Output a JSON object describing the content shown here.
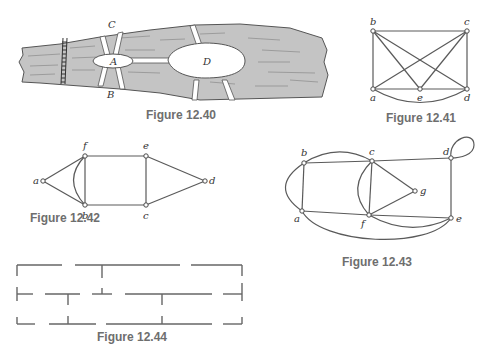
{
  "figures": {
    "fig40": {
      "caption": "Figure 12.40",
      "labels": {
        "A": "A",
        "B": "B",
        "C": "C",
        "D": "D"
      },
      "colors": {
        "river": "#c4c4c4",
        "land": "#ffffff",
        "outline": "#555555"
      }
    },
    "fig41": {
      "caption": "Figure 12.41",
      "vertices": [
        "a",
        "b",
        "c",
        "d",
        "e"
      ],
      "edges": [
        [
          "b",
          "c"
        ],
        [
          "b",
          "a"
        ],
        [
          "c",
          "d"
        ],
        [
          "a",
          "e"
        ],
        [
          "e",
          "d"
        ],
        [
          "b",
          "e"
        ],
        [
          "b",
          "d"
        ],
        [
          "c",
          "a"
        ],
        [
          "c",
          "e"
        ],
        [
          "a",
          "d"
        ]
      ]
    },
    "fig42": {
      "caption": "Figure 12.42",
      "vertices": [
        "a",
        "b",
        "c",
        "d",
        "e",
        "f"
      ],
      "edges": [
        [
          "a",
          "f"
        ],
        [
          "a",
          "b"
        ],
        [
          "f",
          "b"
        ],
        [
          "f",
          "b"
        ],
        [
          "f",
          "e"
        ],
        [
          "b",
          "c"
        ],
        [
          "e",
          "c"
        ],
        [
          "e",
          "d"
        ],
        [
          "c",
          "d"
        ]
      ]
    },
    "fig43": {
      "caption": "Figure 12.43",
      "vertices": [
        "a",
        "b",
        "c",
        "d",
        "e",
        "f",
        "g"
      ],
      "edges": [
        [
          "a",
          "b"
        ],
        [
          "a",
          "b"
        ],
        [
          "b",
          "c"
        ],
        [
          "b",
          "c"
        ],
        [
          "c",
          "d"
        ],
        [
          "d",
          "d"
        ],
        [
          "d",
          "e"
        ],
        [
          "c",
          "g"
        ],
        [
          "g",
          "f"
        ],
        [
          "c",
          "f"
        ],
        [
          "c",
          "f"
        ],
        [
          "a",
          "f"
        ],
        [
          "f",
          "e"
        ],
        [
          "f",
          "e"
        ],
        [
          "a",
          "e"
        ]
      ]
    },
    "fig44": {
      "caption": "Figure 12.44"
    }
  }
}
